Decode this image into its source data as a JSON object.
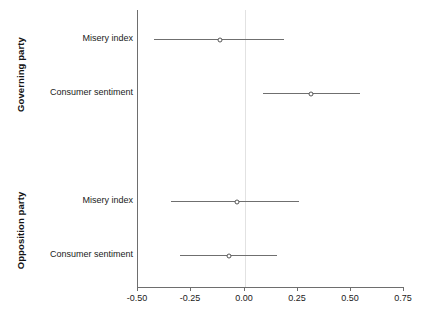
{
  "chart_data": {
    "type": "scatter",
    "plot_kind": "coefficient-forest-plot",
    "title": "",
    "xlabel": "",
    "ylabel": "",
    "xlim": [
      -0.5,
      0.75
    ],
    "xticks": [
      -0.5,
      -0.25,
      0.0,
      0.25,
      0.5,
      0.75
    ],
    "xticklabels": [
      "-0.50",
      "-0.25",
      "0.00",
      "0.25",
      "0.50",
      "0.75"
    ],
    "grid": false,
    "legend": "none",
    "reference_line": 0.0,
    "marker": "open-circle",
    "groups": [
      {
        "name": "Governing party",
        "rows": [
          {
            "label": "Misery index",
            "estimate": -0.11,
            "ci_low": -0.42,
            "ci_high": 0.19
          },
          {
            "label": "Consumer sentiment",
            "estimate": 0.32,
            "ci_low": 0.09,
            "ci_high": 0.55
          }
        ]
      },
      {
        "name": "Opposition party",
        "rows": [
          {
            "label": "Misery index",
            "estimate": -0.03,
            "ci_low": -0.34,
            "ci_high": 0.26
          },
          {
            "label": "Consumer sentiment",
            "estimate": -0.07,
            "ci_low": -0.3,
            "ci_high": 0.16
          }
        ]
      }
    ]
  },
  "axis": {
    "tick_0": "-0.50",
    "tick_1": "-0.25",
    "tick_2": "0.00",
    "tick_3": "0.25",
    "tick_4": "0.50",
    "tick_5": "0.75"
  },
  "panels": {
    "top_label": "Governing party",
    "bottom_label": "Opposition party"
  },
  "rows": {
    "r0_label": "Misery index",
    "r1_label": "Consumer sentiment",
    "r2_label": "Misery index",
    "r3_label": "Consumer sentiment"
  },
  "colors": {
    "axis": "#6e6e6e",
    "interval": "#6f6f6f",
    "marker_edge": "#555555",
    "marker_fill": "#ffffff",
    "reference_line": "#e2e2e2",
    "text": "#1a1a1a",
    "background": "#ffffff"
  }
}
